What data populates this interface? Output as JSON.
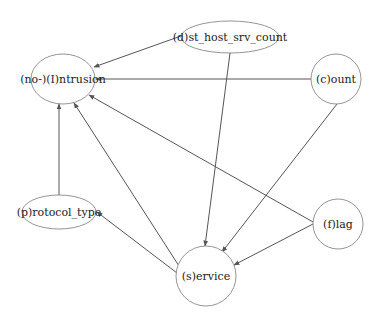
{
  "diagram": {
    "type": "directed-graph",
    "nodes": [
      {
        "id": "intrusion",
        "label": "(no-)(I)ntrusion",
        "shape": "ellipse",
        "cx": 63,
        "cy": 79,
        "rx": 32,
        "ry": 25
      },
      {
        "id": "dst_host_srv_count",
        "label": "(d)st_host_srv_count",
        "shape": "ellipse",
        "cx": 230,
        "cy": 37,
        "rx": 49,
        "ry": 16
      },
      {
        "id": "count",
        "label": "(c)ount",
        "shape": "circle",
        "cx": 336,
        "cy": 79,
        "rx": 25,
        "ry": 25
      },
      {
        "id": "protocol_type",
        "label": "(p)rotocol_type",
        "shape": "ellipse",
        "cx": 59,
        "cy": 212,
        "rx": 37,
        "ry": 17
      },
      {
        "id": "flag",
        "label": "(f)lag",
        "shape": "circle",
        "cx": 338,
        "cy": 224,
        "rx": 25,
        "ry": 25
      },
      {
        "id": "service",
        "label": "(s)ervice",
        "shape": "circle",
        "cx": 206,
        "cy": 276,
        "rx": 30,
        "ry": 30
      }
    ],
    "edges": [
      {
        "from": "dst_host_srv_count",
        "to": "intrusion",
        "x1": 181,
        "y1": 36,
        "x2": 94,
        "y2": 67
      },
      {
        "from": "count",
        "to": "intrusion",
        "x1": 311,
        "y1": 79,
        "x2": 96,
        "y2": 79
      },
      {
        "from": "protocol_type",
        "to": "intrusion",
        "x1": 59,
        "y1": 195,
        "x2": 59,
        "y2": 104
      },
      {
        "from": "service",
        "to": "intrusion",
        "x1": 179,
        "y1": 266,
        "x2": 74,
        "y2": 103
      },
      {
        "from": "flag",
        "to": "intrusion",
        "x1": 313,
        "y1": 222,
        "x2": 89,
        "y2": 95
      },
      {
        "from": "dst_host_srv_count",
        "to": "service",
        "x1": 230,
        "y1": 53,
        "x2": 205,
        "y2": 246
      },
      {
        "from": "count",
        "to": "service",
        "x1": 337,
        "y1": 104,
        "x2": 222,
        "y2": 252
      },
      {
        "from": "flag",
        "to": "service",
        "x1": 313,
        "y1": 224,
        "x2": 234,
        "y2": 265
      },
      {
        "from": "service",
        "to": "protocol_type",
        "x1": 177,
        "y1": 273,
        "x2": 97,
        "y2": 212
      }
    ],
    "colors": {
      "edge": "#555555",
      "node_stroke": "#888888",
      "text": "#222222",
      "background": "#ffffff"
    }
  }
}
